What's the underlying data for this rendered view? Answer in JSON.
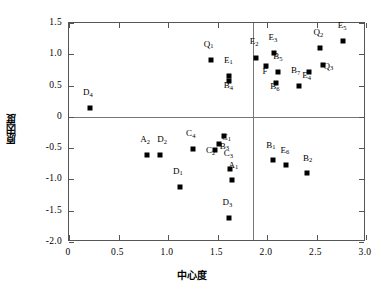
{
  "chart_data": {
    "type": "scatter",
    "title": "",
    "xlabel": "中心度",
    "ylabel": "原因度",
    "xlim": [
      0,
      3.0
    ],
    "ylim": [
      -2.0,
      1.5
    ],
    "xticks": [
      "0",
      "0.5",
      "1.0",
      "1.5",
      "2.0",
      "2.5",
      "3.0"
    ],
    "xtickvals": [
      0,
      0.5,
      1.0,
      1.5,
      2.0,
      2.5,
      3.0
    ],
    "yticks": [
      "1.5",
      "1.0",
      "0.5",
      "0",
      "-0.5",
      "-1.0",
      "-1.5",
      "-2.0"
    ],
    "ytickvals": [
      1.5,
      1.0,
      0.5,
      0,
      -0.5,
      -1.0,
      -1.5,
      -2.0
    ],
    "grid": false,
    "legend": false,
    "marker": "filled-square",
    "marker_color": "#000000",
    "dividers": {
      "vertical_x": 1.86,
      "horizontal_y": 0.0
    },
    "points": [
      {
        "label": "D",
        "sub": "4",
        "x": 0.22,
        "y": 0.13,
        "lx": 0.2,
        "ly": 0.3
      },
      {
        "label": "A",
        "sub": "2",
        "x": 0.8,
        "y": -0.62,
        "lx": 0.78,
        "ly": -0.45
      },
      {
        "label": "D",
        "sub": "2",
        "x": 0.93,
        "y": -0.62,
        "lx": 0.95,
        "ly": -0.45
      },
      {
        "label": "D",
        "sub": "1",
        "x": 1.13,
        "y": -1.13,
        "lx": 1.11,
        "ly": -0.96
      },
      {
        "label": "C",
        "sub": "4",
        "x": 1.26,
        "y": -0.53,
        "lx": 1.24,
        "ly": -0.36
      },
      {
        "label": "Q",
        "sub": "1",
        "x": 1.44,
        "y": 0.89,
        "lx": 1.42,
        "ly": 1.07
      },
      {
        "label": "C",
        "sub": "2",
        "x": 1.48,
        "y": -0.54,
        "lx": 1.44,
        "ly": -0.63
      },
      {
        "label": "B",
        "sub": "3",
        "x": 1.53,
        "y": -0.45,
        "lx": 1.58,
        "ly": -0.56
      },
      {
        "label": "C",
        "sub": "1",
        "x": 1.58,
        "y": -0.32,
        "lx": 1.6,
        "ly": -0.41
      },
      {
        "label": "E",
        "sub": "1",
        "x": 1.63,
        "y": 0.63,
        "lx": 1.62,
        "ly": 0.82
      },
      {
        "label": "B",
        "sub": "4",
        "x": 1.63,
        "y": 0.55,
        "lx": 1.62,
        "ly": 0.41
      },
      {
        "label": "C",
        "sub": "3",
        "x": 1.64,
        "y": -0.85,
        "lx": 1.62,
        "ly": -0.68
      },
      {
        "label": "A",
        "sub": "1",
        "x": 1.66,
        "y": -1.03,
        "lx": 1.67,
        "ly": -0.86
      },
      {
        "label": "D",
        "sub": "3",
        "x": 1.63,
        "y": -1.63,
        "lx": 1.61,
        "ly": -1.46
      },
      {
        "label": "E",
        "sub": "2",
        "x": 1.9,
        "y": 0.93,
        "lx": 1.88,
        "ly": 1.11
      },
      {
        "label": "F",
        "sub": "",
        "x": 2.0,
        "y": 0.8,
        "lx": 1.99,
        "ly": 0.64
      },
      {
        "label": "E",
        "sub": "3",
        "x": 2.08,
        "y": 1.0,
        "lx": 2.07,
        "ly": 1.18
      },
      {
        "label": "B",
        "sub": "5",
        "x": 2.12,
        "y": 0.7,
        "lx": 2.12,
        "ly": 0.87
      },
      {
        "label": "B",
        "sub": "6",
        "x": 2.1,
        "y": 0.53,
        "lx": 2.09,
        "ly": 0.39
      },
      {
        "label": "B",
        "sub": "1",
        "x": 2.07,
        "y": -0.71,
        "lx": 2.05,
        "ly": -0.54
      },
      {
        "label": "E",
        "sub": "6",
        "x": 2.2,
        "y": -0.79,
        "lx": 2.19,
        "ly": -0.62
      },
      {
        "label": "B",
        "sub": "7",
        "x": 2.33,
        "y": 0.48,
        "lx": 2.3,
        "ly": 0.65
      },
      {
        "label": "B",
        "sub": "2",
        "x": 2.41,
        "y": -0.92,
        "lx": 2.42,
        "ly": -0.75
      },
      {
        "label": "E",
        "sub": "4",
        "x": 2.43,
        "y": 0.7,
        "lx": 2.41,
        "ly": 0.57
      },
      {
        "label": "Q",
        "sub": "2",
        "x": 2.55,
        "y": 1.08,
        "lx": 2.53,
        "ly": 1.26
      },
      {
        "label": "Q",
        "sub": "3",
        "x": 2.58,
        "y": 0.81,
        "lx": 2.63,
        "ly": 0.72
      },
      {
        "label": "E",
        "sub": "5",
        "x": 2.78,
        "y": 1.19,
        "lx": 2.77,
        "ly": 1.37
      }
    ]
  }
}
